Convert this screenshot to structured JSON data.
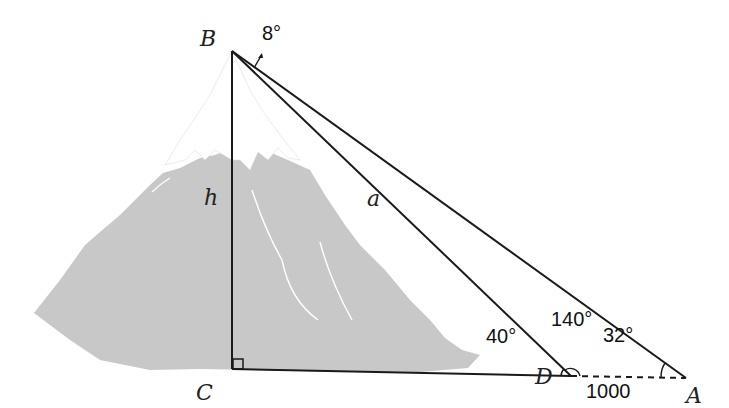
{
  "diagram": {
    "type": "geometry-trig-mountain-height",
    "points": {
      "B": {
        "label": "B",
        "x": 232,
        "y": 51
      },
      "C": {
        "label": "C",
        "x": 232,
        "y": 368
      },
      "D": {
        "label": "D",
        "x": 570,
        "y": 375
      },
      "A": {
        "label": "A",
        "x": 686,
        "y": 378
      }
    },
    "segments": {
      "h": {
        "label": "h",
        "from": "B",
        "to": "C"
      },
      "a": {
        "label": "a",
        "from": "B",
        "to": "D"
      },
      "BA": {
        "from": "B",
        "to": "A"
      },
      "CD": {
        "from": "C",
        "to": "D"
      },
      "DA": {
        "from": "D",
        "to": "A",
        "style": "dashed",
        "label": "1000"
      }
    },
    "angles": {
      "angle_B": "8°",
      "angle_BDC": "40°",
      "angle_BDA": "140°",
      "angle_A": "32°",
      "angle_C": "right-angle"
    },
    "colors": {
      "mountain": "#c8c8c8",
      "snow": "#ffffff",
      "lines": "#1a1a1a"
    }
  }
}
